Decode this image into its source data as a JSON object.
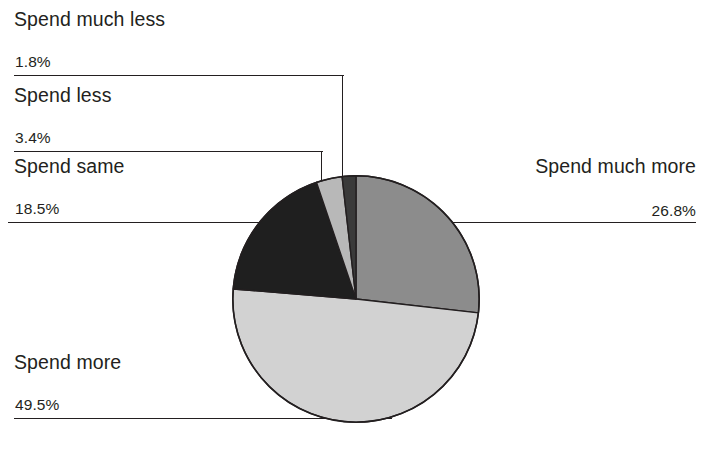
{
  "chart_data": {
    "type": "pie",
    "title": "",
    "xlabel": "",
    "ylabel": "",
    "legend_position": "callout-labels",
    "grid": false,
    "start_angle_deg": 0,
    "direction": "clockwise",
    "categories": [
      "Spend much more",
      "Spend more",
      "Spend same",
      "Spend less",
      "Spend much less"
    ],
    "values": [
      26.8,
      49.5,
      18.5,
      3.4,
      1.8
    ],
    "value_suffix": "%",
    "slice_colors": [
      "#8c8c8c",
      "#d2d2d2",
      "#1f1f1f",
      "#b8b8b8",
      "#3a3a3a"
    ],
    "slices": [
      {
        "label": "Spend much more",
        "value": 26.8,
        "display": "26.8%",
        "color": "#8c8c8c"
      },
      {
        "label": "Spend more",
        "value": 49.5,
        "display": "49.5%",
        "color": "#d2d2d2"
      },
      {
        "label": "Spend same",
        "value": 18.5,
        "display": "18.5%",
        "color": "#1f1f1f"
      },
      {
        "label": "Spend less",
        "value": 3.4,
        "display": "3.4%",
        "color": "#b8b8b8"
      },
      {
        "label": "Spend much less",
        "value": 1.8,
        "display": "1.8%",
        "color": "#3a3a3a"
      }
    ]
  },
  "labels": {
    "much_less": {
      "name": "Spend much less",
      "pct": "1.8%"
    },
    "less": {
      "name": "Spend less",
      "pct": "3.4%"
    },
    "same": {
      "name": "Spend same",
      "pct": "18.5%"
    },
    "more": {
      "name": "Spend more",
      "pct": "49.5%"
    },
    "much_more": {
      "name": "Spend much more",
      "pct": "26.8%"
    }
  },
  "colors": {
    "text": "#231f20",
    "line": "#231f20",
    "background": "#ffffff",
    "slice_outline": "#231f20"
  }
}
